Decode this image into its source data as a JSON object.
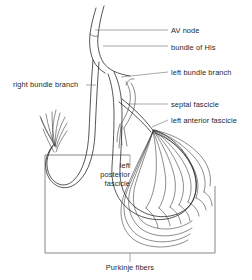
{
  "figure": {
    "width": 252,
    "height": 280,
    "background_color": "#ffffff",
    "line_color": "#2b2b2b",
    "leader_color": "#6e6e6e",
    "text_color": "#1f1f1f"
  },
  "labels": {
    "av_node": "AV node",
    "bundle_of_his": "bundle of His",
    "left_bundle_branch": "left bundle branch",
    "septal_fascicle": "septal fascicle",
    "left_anterior_fascicle": "left anterior fascicle",
    "right_bundle_branch": "right bundle branch",
    "left_posterior_fascicle_line1": "left",
    "left_posterior_fascicle_line2": "posterior",
    "left_posterior_fascicle_line3": "fascicle",
    "purkinje_fibers": "Purkinje  fibers"
  },
  "structures": [
    {
      "name": "av-node",
      "label": "AV node"
    },
    {
      "name": "bundle-of-his",
      "label": "bundle of His"
    },
    {
      "name": "left-bundle-branch",
      "label": "left bundle branch"
    },
    {
      "name": "septal-fascicle",
      "label": "septal fascicle"
    },
    {
      "name": "left-anterior-fascicle",
      "label": "left anterior fascicle"
    },
    {
      "name": "right-bundle-branch",
      "label": "right bundle branch"
    },
    {
      "name": "left-posterior-fascicle",
      "label": "left posterior fascicle"
    },
    {
      "name": "purkinje-fibers",
      "label": "Purkinje fibers"
    }
  ]
}
